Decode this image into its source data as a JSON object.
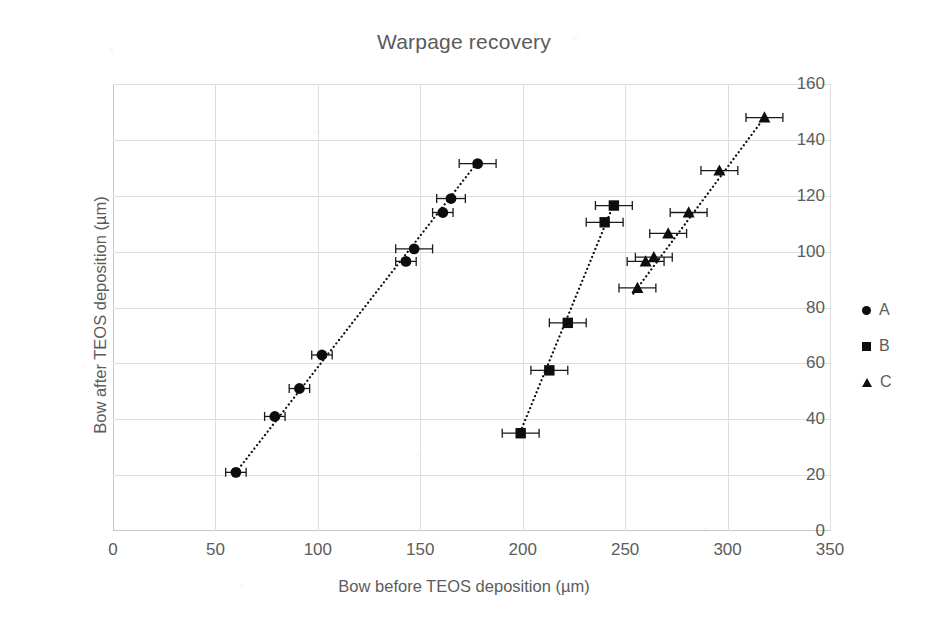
{
  "chart_data": {
    "type": "scatter",
    "title": "Warpage recovery",
    "xlabel": "Bow before TEOS deposition (µm)",
    "ylabel": "Bow after TEOS deposition (µm)",
    "xlim": [
      0,
      350
    ],
    "ylim": [
      0,
      160
    ],
    "xticks": [
      0,
      50,
      100,
      150,
      200,
      250,
      300,
      350
    ],
    "yticks": [
      0,
      20,
      40,
      60,
      80,
      100,
      120,
      140,
      160
    ],
    "grid": true,
    "legend_position": "right",
    "marker_color": "#0d0d0d",
    "gridline_color": "#dedede",
    "trendline_style": "dotted",
    "error_bars": "x-direction, horizontal caps",
    "series": [
      {
        "name": "A",
        "marker": "circle",
        "points": [
          {
            "x": 60,
            "y": 21,
            "xerr": 5
          },
          {
            "x": 79,
            "y": 41,
            "xerr": 5
          },
          {
            "x": 91,
            "y": 51,
            "xerr": 5
          },
          {
            "x": 102,
            "y": 63,
            "xerr": 5
          },
          {
            "x": 143,
            "y": 96.5,
            "xerr": 5
          },
          {
            "x": 147,
            "y": 101,
            "xerr": 9
          },
          {
            "x": 161,
            "y": 114,
            "xerr": 5
          },
          {
            "x": 165,
            "y": 119,
            "xerr": 7
          },
          {
            "x": 178,
            "y": 131.5,
            "xerr": 9
          }
        ],
        "trendline": {
          "x1": 60,
          "y1": 21,
          "x2": 179,
          "y2": 133
        }
      },
      {
        "name": "B",
        "marker": "square",
        "points": [
          {
            "x": 199,
            "y": 35,
            "xerr": 9
          },
          {
            "x": 213,
            "y": 57.5,
            "xerr": 9
          },
          {
            "x": 222,
            "y": 74.5,
            "xerr": 9
          },
          {
            "x": 240,
            "y": 110.5,
            "xerr": 9
          },
          {
            "x": 244.5,
            "y": 116.5,
            "xerr": 9
          }
        ],
        "trendline": {
          "x1": 198,
          "y1": 34,
          "x2": 245,
          "y2": 118
        }
      },
      {
        "name": "C",
        "marker": "triangle",
        "points": [
          {
            "x": 256,
            "y": 87,
            "xerr": 9
          },
          {
            "x": 260,
            "y": 96.5,
            "xerr": 9
          },
          {
            "x": 264,
            "y": 98,
            "xerr": 9
          },
          {
            "x": 271,
            "y": 106.5,
            "xerr": 9
          },
          {
            "x": 281,
            "y": 114,
            "xerr": 9
          },
          {
            "x": 296,
            "y": 129,
            "xerr": 9
          },
          {
            "x": 318,
            "y": 148,
            "xerr": 9
          }
        ],
        "trendline": {
          "x1": 254,
          "y1": 85,
          "x2": 319,
          "y2": 149
        }
      }
    ]
  },
  "legend": {
    "items": [
      {
        "label": "A",
        "marker": "circle"
      },
      {
        "label": "B",
        "marker": "square"
      },
      {
        "label": "C",
        "marker": "triangle"
      }
    ]
  }
}
